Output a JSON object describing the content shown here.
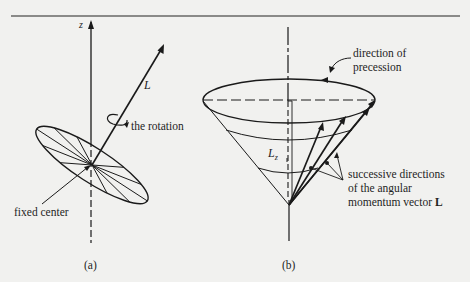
{
  "figure": {
    "panel_a": {
      "caption": "(a)",
      "axis_label": "z",
      "vector_label": "L",
      "rotation_label": "the rotation",
      "center_label": "fixed center"
    },
    "panel_b": {
      "caption": "(b)",
      "component_label": "L",
      "component_subscript": "z",
      "precession_label_line1": "direction of",
      "precession_label_line2": "precession",
      "successive_label_line1": "successive directions",
      "successive_label_line2": "of the angular",
      "successive_label_line3": "momentum vector ",
      "successive_label_bold": "L"
    }
  },
  "colors": {
    "background": "#f1f1ef",
    "ink": "#1a1a1a",
    "rule": "#8a8a88"
  }
}
